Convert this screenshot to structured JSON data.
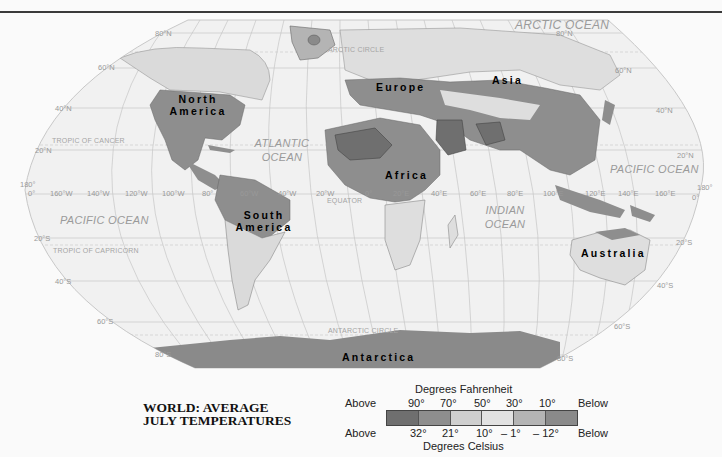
{
  "title": {
    "line1": "WORLD: AVERAGE",
    "line2": "JULY TEMPERATURES"
  },
  "legend": {
    "fahrenheit_label": "Degrees Fahrenheit",
    "celsius_label": "Degrees Celsius",
    "above": "Above",
    "below": "Below",
    "fahrenheit_ticks": [
      "90°",
      "70°",
      "50°",
      "30°",
      "10°"
    ],
    "celsius_ticks": [
      "32°",
      "21°",
      "10°",
      "– 1°",
      "– 12°"
    ],
    "classes": [
      {
        "range_f": "Above 90°",
        "range_c": "Above 32°",
        "color": "#6f6f6f"
      },
      {
        "range_f": "70°–90°",
        "range_c": "21°–32°",
        "color": "#8e8e8e"
      },
      {
        "range_f": "50°–70°",
        "range_c": "10°–21°",
        "color": "#cfcfcf"
      },
      {
        "range_f": "30°–50°",
        "range_c": "–1°–10°",
        "color": "#e2e2e2"
      },
      {
        "range_f": "10°–30°",
        "range_c": "–12°– –1°",
        "color": "#b4b4b4"
      },
      {
        "range_f": "Below 10°",
        "range_c": "Below –12°",
        "color": "#8a8a8a"
      }
    ]
  },
  "map": {
    "continents": {
      "north_america": "North America",
      "south_america": "South America",
      "europe": "Europe",
      "asia": "Asia",
      "africa": "Africa",
      "australia": "Australia",
      "antarctica": "Antarctica"
    },
    "oceans": {
      "arctic": "ARCTIC OCEAN",
      "atlantic_1": "ATLANTIC",
      "atlantic_2": "OCEAN",
      "pacific_west": "PACIFIC OCEAN",
      "pacific_east": "PACIFIC OCEAN",
      "indian_1": "INDIAN",
      "indian_2": "OCEAN"
    },
    "circles": {
      "arctic_circle": "ARCTIC CIRCLE",
      "antarctic_circle": "ANTARCTIC CIRCLE",
      "tropic_cancer": "TROPIC OF CANCER",
      "tropic_capricorn": "TROPIC OF CAPRICORN",
      "equator": "EQUATOR"
    },
    "latitudes": {
      "n80_left": "80°N",
      "n60_left": "60°N",
      "n40_left": "40°N",
      "n20_left": "20°N",
      "zero_left": "0°",
      "s20_left": "20°S",
      "s40_left": "40°S",
      "s60_left": "60°S",
      "s80_left": "80°S",
      "n80_right": "80°N",
      "n60_right": "60°N",
      "n40_right": "40°N",
      "n20_right": "20°N",
      "zero_right": "0°",
      "s20_right": "20°S",
      "s40_right": "40°S",
      "s60_right": "60°S",
      "s80_right": "80°S"
    },
    "longitudes": {
      "w180": "180°",
      "w160": "160°W",
      "w140": "140°W",
      "w120": "120°W",
      "w100": "100°W",
      "w80": "80°",
      "w60": "60°W",
      "w40": "40°W",
      "w20": "20°W",
      "zero": "0°",
      "e20": "20°E",
      "e40": "40°E",
      "e60": "60°E",
      "e80": "80°E",
      "e100": "100°E",
      "e120": "120°E",
      "e140": "140°E",
      "e160": "160°E",
      "e180": "180°"
    }
  },
  "colors": {
    "above90": "#6f6f6f",
    "f70_90": "#8e8e8e",
    "f50_70": "#cfcfcf",
    "f30_50": "#e2e2e2",
    "f10_30": "#b4b4b4",
    "below10": "#8a8a8a",
    "ocean": "#f1f1f1",
    "grid": "#c4c4c4"
  }
}
